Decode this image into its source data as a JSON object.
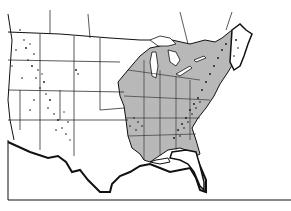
{
  "map": {
    "type": "outline map",
    "subject": "Contiguous United States",
    "shaded_region_color": "#b8b8b8",
    "border_color": "#111111",
    "stipple_color": "#111111",
    "background_color": "#ffffff",
    "shaded_region": "Eastern United States (east of the Great Plains)",
    "stippled_regions": [
      "Rocky Mountains",
      "Appalachian Mountains",
      "Ozark region"
    ],
    "labels": []
  }
}
